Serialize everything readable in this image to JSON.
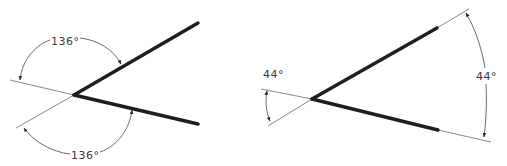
{
  "diagrams": [
    {
      "name": "obtuse-angle-figure",
      "angle_labels": [
        {
          "text": "136°",
          "position": "upper"
        },
        {
          "text": "136°",
          "position": "lower"
        }
      ]
    },
    {
      "name": "acute-angle-figure",
      "angle_labels": [
        {
          "text": "44°",
          "position": "left"
        },
        {
          "text": "44°",
          "position": "right"
        }
      ]
    }
  ],
  "colors": {
    "line": "#1e1e1e",
    "construction": "#6a6a6a",
    "background": "#ffffff"
  }
}
